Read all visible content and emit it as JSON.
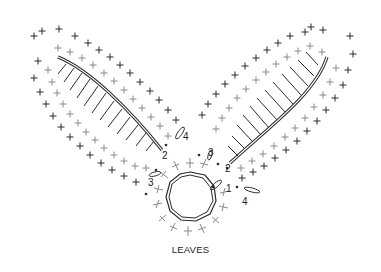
{
  "diagram": {
    "title": "LEAVES",
    "colors": {
      "dark_stitch": "#2a2a2a",
      "light_stitch": "#8a8a8a",
      "background": "#ffffff"
    },
    "round_labels": [
      {
        "text": "1",
        "x": 226,
        "y": 184
      },
      {
        "text": "2",
        "x": 162,
        "y": 151
      },
      {
        "text": "2",
        "x": 225,
        "y": 164
      },
      {
        "text": "3",
        "x": 148,
        "y": 178
      },
      {
        "text": "3",
        "x": 208,
        "y": 148
      },
      {
        "text": "4",
        "x": 183,
        "y": 132
      },
      {
        "text": "4",
        "x": 242,
        "y": 197
      }
    ],
    "legend": {
      "stitch_symbols": [
        "single-crochet-cross",
        "double-crochet-bar",
        "chain-oval",
        "slip-stitch-dot",
        "chain-ring"
      ]
    }
  }
}
